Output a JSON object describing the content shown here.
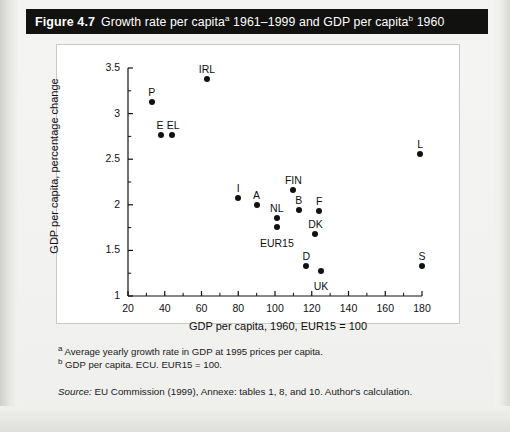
{
  "figure": {
    "number": "Figure 4.7",
    "title_part1": "Growth rate per capita",
    "title_sup_a": "a",
    "title_part2": " 1961–1999 and GDP per capita",
    "title_sup_b": "b",
    "title_part3": " 1960"
  },
  "notes": {
    "note_a_marker": "a",
    "note_a": " Average yearly growth rate in GDP at 1995 prices per capita.",
    "note_b_marker": "b",
    "note_b": " GDP per capita. ECU. EUR15 = 100.",
    "source_label": "Source:",
    "source_text": " EU Commission (1999), Annexe: tables 1, 8, and 10. Author's calculation."
  },
  "chart_data": {
    "type": "scatter",
    "xlabel": "GDP per capita, 1960, EUR15 = 100",
    "ylabel": "GDP per capita, percentage change",
    "xlim": [
      20,
      180
    ],
    "ylim": [
      1,
      3.5
    ],
    "xticks": [
      20,
      40,
      60,
      80,
      100,
      120,
      140,
      160,
      180
    ],
    "xtick_labels": [
      "20",
      "40",
      "60",
      "80",
      "100",
      "120",
      "140",
      "160",
      "180"
    ],
    "xminor_step": 10,
    "yticks": [
      1,
      1.5,
      2,
      2.5,
      3,
      3.5
    ],
    "ytick_labels": [
      "1",
      "1.5",
      "2",
      "2.5",
      "3",
      "3.5"
    ],
    "yminor_step": 0.25,
    "grid": false,
    "legend": false,
    "points": [
      {
        "label": "P",
        "x": 33,
        "y": 3.13,
        "label_dx": 0,
        "label_dy": -11
      },
      {
        "label": "E",
        "x": 38,
        "y": 2.77,
        "label_dx": -1,
        "label_dy": -11
      },
      {
        "label": "EL",
        "x": 44,
        "y": 2.77,
        "label_dx": 1,
        "label_dy": -11
      },
      {
        "label": "IRL",
        "x": 63,
        "y": 3.38,
        "label_dx": 0,
        "label_dy": -11
      },
      {
        "label": "I",
        "x": 80,
        "y": 2.07,
        "label_dx": 0,
        "label_dy": -11
      },
      {
        "label": "A",
        "x": 90,
        "y": 2.0,
        "label_dx": 0,
        "label_dy": -11
      },
      {
        "label": "NL",
        "x": 101,
        "y": 1.85,
        "label_dx": 0,
        "label_dy": -11
      },
      {
        "label": "FIN",
        "x": 110,
        "y": 2.16,
        "label_dx": 0,
        "label_dy": -11
      },
      {
        "label": "B",
        "x": 113,
        "y": 1.94,
        "label_dx": 0,
        "label_dy": -11
      },
      {
        "label": "EUR15",
        "x": 101,
        "y": 1.76,
        "label_dx": 0,
        "label_dy": 15
      },
      {
        "label": "F",
        "x": 124,
        "y": 1.93,
        "label_dx": 0,
        "label_dy": -11
      },
      {
        "label": "DK",
        "x": 122,
        "y": 1.68,
        "label_dx": 0,
        "label_dy": -11
      },
      {
        "label": "D",
        "x": 117,
        "y": 1.33,
        "label_dx": 0,
        "label_dy": -11
      },
      {
        "label": "UK",
        "x": 125,
        "y": 1.27,
        "label_dx": 0,
        "label_dy": 14
      },
      {
        "label": "L",
        "x": 179,
        "y": 2.56,
        "label_dx": 0,
        "label_dy": -11
      },
      {
        "label": "S",
        "x": 180,
        "y": 1.33,
        "label_dx": 0,
        "label_dy": -11
      }
    ]
  }
}
